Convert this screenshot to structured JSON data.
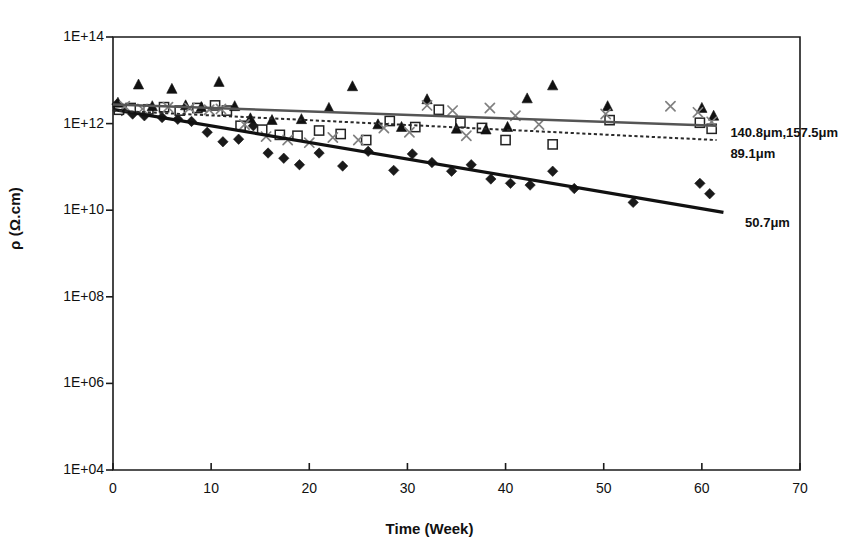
{
  "chart_data": {
    "type": "scatter",
    "title": "",
    "subtitle": "",
    "xlabel": "Time (Week)",
    "ylabel": "ρ (Ω.cm)",
    "xlim": [
      0,
      70
    ],
    "ylim_exp": [
      4,
      14
    ],
    "yscale": "log",
    "grid": false,
    "legend_position": "inline-right-annotations",
    "xticks": [
      "0",
      "10",
      "20",
      "30",
      "40",
      "50",
      "60",
      "70"
    ],
    "xtick_values": [
      0,
      10,
      20,
      30,
      40,
      50,
      60,
      70
    ],
    "yticks": [
      "1E+04",
      "1E+06",
      "1E+08",
      "1E+10",
      "1E+12",
      "1E+14"
    ],
    "ytick_exponents": [
      4,
      6,
      8,
      10,
      12,
      14
    ],
    "annotations": [
      {
        "name": "label-140-157",
        "text": "140.8μm,157.5μm",
        "x": 62.5,
        "y_exp": 11.78
      },
      {
        "name": "label-89",
        "text": "89.1μm",
        "x": 62.5,
        "y_exp": 11.3
      },
      {
        "name": "label-50",
        "text": "50.7μm",
        "x": 64.0,
        "y_exp": 9.7
      }
    ],
    "series": [
      {
        "name": "50.7μm",
        "marker": "filled-diamond",
        "color": "#1a1a1a",
        "trendline": {
          "style": "solid-thick",
          "width": 3.2,
          "color": "#111111",
          "x0": 0,
          "y0_exp": 12.33,
          "x1": 62.2,
          "y1_exp": 9.95
        },
        "points": [
          {
            "x": 0.4,
            "y_exp": 12.45
          },
          {
            "x": 0.9,
            "y_exp": 12.3
          },
          {
            "x": 2.0,
            "y_exp": 12.22
          },
          {
            "x": 3.2,
            "y_exp": 12.18
          },
          {
            "x": 5.0,
            "y_exp": 12.14
          },
          {
            "x": 6.6,
            "y_exp": 12.1
          },
          {
            "x": 8.0,
            "y_exp": 12.05
          },
          {
            "x": 9.6,
            "y_exp": 11.8
          },
          {
            "x": 11.2,
            "y_exp": 11.58
          },
          {
            "x": 12.8,
            "y_exp": 11.64
          },
          {
            "x": 14.3,
            "y_exp": 11.95
          },
          {
            "x": 15.8,
            "y_exp": 11.32
          },
          {
            "x": 17.4,
            "y_exp": 11.2
          },
          {
            "x": 19.0,
            "y_exp": 11.05
          },
          {
            "x": 21.0,
            "y_exp": 11.32
          },
          {
            "x": 23.4,
            "y_exp": 11.02
          },
          {
            "x": 26.0,
            "y_exp": 11.36
          },
          {
            "x": 28.6,
            "y_exp": 10.92
          },
          {
            "x": 30.5,
            "y_exp": 11.3
          },
          {
            "x": 32.5,
            "y_exp": 11.1
          },
          {
            "x": 34.5,
            "y_exp": 10.9
          },
          {
            "x": 36.5,
            "y_exp": 11.05
          },
          {
            "x": 38.5,
            "y_exp": 10.72
          },
          {
            "x": 40.5,
            "y_exp": 10.62
          },
          {
            "x": 42.5,
            "y_exp": 10.58
          },
          {
            "x": 44.8,
            "y_exp": 10.9
          },
          {
            "x": 47.0,
            "y_exp": 10.5
          },
          {
            "x": 53.0,
            "y_exp": 10.18
          },
          {
            "x": 59.8,
            "y_exp": 10.62
          },
          {
            "x": 60.8,
            "y_exp": 10.38
          }
        ]
      },
      {
        "name": "89.1μm",
        "marker": "open-square",
        "color": "#222222",
        "trendline": {
          "style": "dotted",
          "width": 2.0,
          "color": "#2a2a2a",
          "x0": 0,
          "y0_exp": 12.3,
          "x1": 61.5,
          "y1_exp": 11.62
        },
        "points": [
          {
            "x": 0.6,
            "y_exp": 12.32
          },
          {
            "x": 1.8,
            "y_exp": 12.36
          },
          {
            "x": 3.6,
            "y_exp": 12.33
          },
          {
            "x": 5.2,
            "y_exp": 12.38
          },
          {
            "x": 6.8,
            "y_exp": 12.3
          },
          {
            "x": 8.6,
            "y_exp": 12.36
          },
          {
            "x": 10.4,
            "y_exp": 12.42
          },
          {
            "x": 11.6,
            "y_exp": 12.3
          },
          {
            "x": 13.0,
            "y_exp": 11.95
          },
          {
            "x": 15.2,
            "y_exp": 11.86
          },
          {
            "x": 17.0,
            "y_exp": 11.74
          },
          {
            "x": 18.8,
            "y_exp": 11.72
          },
          {
            "x": 21.0,
            "y_exp": 11.84
          },
          {
            "x": 23.2,
            "y_exp": 11.76
          },
          {
            "x": 25.8,
            "y_exp": 11.62
          },
          {
            "x": 28.2,
            "y_exp": 12.06
          },
          {
            "x": 30.8,
            "y_exp": 11.92
          },
          {
            "x": 33.2,
            "y_exp": 12.32
          },
          {
            "x": 35.4,
            "y_exp": 12.02
          },
          {
            "x": 37.6,
            "y_exp": 11.9
          },
          {
            "x": 40.0,
            "y_exp": 11.62
          },
          {
            "x": 44.8,
            "y_exp": 11.52
          },
          {
            "x": 50.6,
            "y_exp": 12.08
          },
          {
            "x": 59.8,
            "y_exp": 12.02
          },
          {
            "x": 61.0,
            "y_exp": 11.88
          }
        ]
      },
      {
        "name": "140.8μm",
        "marker": "filled-triangle",
        "color": "#111111",
        "trendline": {
          "style": "solid-grey",
          "width": 2.4,
          "color": "#555555",
          "x0": 0,
          "y0_exp": 12.44,
          "x1": 61.5,
          "y1_exp": 11.95
        },
        "points": [
          {
            "x": 0.5,
            "y_exp": 12.48
          },
          {
            "x": 2.6,
            "y_exp": 12.9
          },
          {
            "x": 4.0,
            "y_exp": 12.4
          },
          {
            "x": 6.0,
            "y_exp": 12.8
          },
          {
            "x": 7.4,
            "y_exp": 12.42
          },
          {
            "x": 9.0,
            "y_exp": 12.38
          },
          {
            "x": 10.8,
            "y_exp": 12.96
          },
          {
            "x": 12.4,
            "y_exp": 12.4
          },
          {
            "x": 14.0,
            "y_exp": 12.12
          },
          {
            "x": 16.2,
            "y_exp": 12.08
          },
          {
            "x": 19.2,
            "y_exp": 12.1
          },
          {
            "x": 22.0,
            "y_exp": 12.36
          },
          {
            "x": 24.4,
            "y_exp": 12.86
          },
          {
            "x": 27.0,
            "y_exp": 11.98
          },
          {
            "x": 29.4,
            "y_exp": 11.92
          },
          {
            "x": 32.0,
            "y_exp": 12.56
          },
          {
            "x": 35.0,
            "y_exp": 11.88
          },
          {
            "x": 38.0,
            "y_exp": 11.86
          },
          {
            "x": 40.2,
            "y_exp": 11.92
          },
          {
            "x": 42.2,
            "y_exp": 12.58
          },
          {
            "x": 44.8,
            "y_exp": 12.88
          },
          {
            "x": 50.4,
            "y_exp": 12.4
          },
          {
            "x": 60.0,
            "y_exp": 12.36
          },
          {
            "x": 61.2,
            "y_exp": 12.18
          }
        ]
      },
      {
        "name": "157.5μm",
        "marker": "cross-x",
        "color": "#808080",
        "trendline": null,
        "points": [
          {
            "x": 1.2,
            "y_exp": 12.4
          },
          {
            "x": 3.0,
            "y_exp": 12.34
          },
          {
            "x": 5.6,
            "y_exp": 12.38
          },
          {
            "x": 7.8,
            "y_exp": 12.36
          },
          {
            "x": 9.8,
            "y_exp": 12.32
          },
          {
            "x": 11.0,
            "y_exp": 12.34
          },
          {
            "x": 13.4,
            "y_exp": 11.98
          },
          {
            "x": 15.6,
            "y_exp": 11.7
          },
          {
            "x": 17.8,
            "y_exp": 11.62
          },
          {
            "x": 20.0,
            "y_exp": 11.56
          },
          {
            "x": 22.4,
            "y_exp": 11.68
          },
          {
            "x": 25.0,
            "y_exp": 11.62
          },
          {
            "x": 27.6,
            "y_exp": 11.9
          },
          {
            "x": 30.2,
            "y_exp": 11.8
          },
          {
            "x": 32.0,
            "y_exp": 12.42
          },
          {
            "x": 34.6,
            "y_exp": 12.3
          },
          {
            "x": 36.0,
            "y_exp": 11.72
          },
          {
            "x": 38.4,
            "y_exp": 12.36
          },
          {
            "x": 41.0,
            "y_exp": 12.18
          },
          {
            "x": 43.4,
            "y_exp": 11.98
          },
          {
            "x": 50.2,
            "y_exp": 12.22
          },
          {
            "x": 56.8,
            "y_exp": 12.4
          },
          {
            "x": 59.6,
            "y_exp": 12.26
          },
          {
            "x": 61.0,
            "y_exp": 12.04
          }
        ]
      }
    ]
  }
}
